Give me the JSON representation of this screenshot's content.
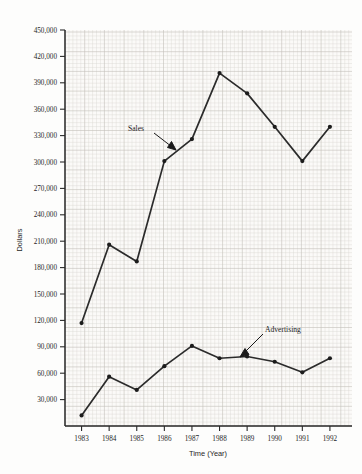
{
  "chart_data": {
    "type": "line",
    "title": "",
    "xlabel": "Time (Year)",
    "ylabel": "Dollars",
    "grid": true,
    "legend_position": "inline-annotations",
    "categories": [
      "1983",
      "1984",
      "1985",
      "1986",
      "1987",
      "1988",
      "1989",
      "1990",
      "1991",
      "1992"
    ],
    "x": [
      1983,
      1984,
      1985,
      1986,
      1987,
      1988,
      1989,
      1990,
      1991,
      1992
    ],
    "xlim": [
      1982.4,
      1992.8
    ],
    "ylim": [
      0,
      450000
    ],
    "ytick_labels": [
      "450,000",
      "420,000",
      "390,000",
      "360,000",
      "330,000",
      "300,000",
      "270,000",
      "240,000",
      "210,000",
      "180,000",
      "150,000",
      "120,000",
      "90,000",
      "60,000",
      "30,000"
    ],
    "yticks": [
      450000,
      420000,
      390000,
      360000,
      330000,
      300000,
      270000,
      240000,
      210000,
      180000,
      150000,
      120000,
      90000,
      60000,
      30000
    ],
    "series": [
      {
        "name": "Sales",
        "values": [
          117000,
          206000,
          187000,
          301000,
          326000,
          401000,
          378000,
          340000,
          301000,
          340000
        ]
      },
      {
        "name": "Advertising",
        "values": [
          12000,
          56000,
          41000,
          68000,
          91000,
          77000,
          79000,
          73000,
          61000,
          77000
        ]
      }
    ],
    "annotations": [
      {
        "text": "Sales",
        "series": "Sales"
      },
      {
        "text": "Advertising",
        "series": "Advertising"
      }
    ]
  },
  "axes": {
    "x_title": "Time (Year)",
    "y_title": "Dollars"
  }
}
